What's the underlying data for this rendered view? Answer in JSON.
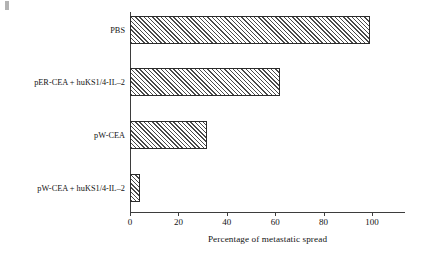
{
  "figure": {
    "artifact": "scan-speck"
  },
  "chart_data": {
    "type": "bar",
    "orientation": "horizontal",
    "title": "",
    "subtitle": "",
    "xlabel": "Percentage of metastatic spread",
    "ylabel": "",
    "categories": [
      "PBS",
      "pER-CEA + huKS1/4-IL–2",
      "pW-CEA",
      "pW-CEA + huKS1/4-IL–2"
    ],
    "values": [
      99,
      62,
      32,
      4
    ],
    "xlim": [
      0,
      113
    ],
    "xticks": [
      0,
      20,
      40,
      60,
      80,
      100
    ],
    "xticklabels": [
      "0",
      "20",
      "40",
      "60",
      "80",
      "100"
    ],
    "grid": false,
    "legend": null,
    "bar_fill": "diagonal-hatch",
    "bar_edge_color": "#2b2b2b",
    "bar_hatch_color": "#4a4a4a",
    "axis_color": "#3d3d3d"
  }
}
